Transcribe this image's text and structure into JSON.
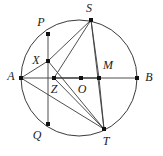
{
  "figure": {
    "background_color": "#ffffff",
    "line_color": "#3b3b3b",
    "highlight_color": "#8c8c8c",
    "dot_color": "#111111",
    "circle": {
      "cx": 79,
      "cy": 78,
      "r": 58
    },
    "points": [
      {
        "id": "P",
        "label": "P",
        "x": 48,
        "y": 34,
        "label_x": 41,
        "label_y": 23
      },
      {
        "id": "S",
        "label": "S",
        "x": 91,
        "y": 20,
        "label_x": 89,
        "label_y": 9
      },
      {
        "id": "X",
        "label": "X",
        "x": 48,
        "y": 61,
        "label_x": 36,
        "label_y": 61
      },
      {
        "id": "A",
        "label": "A",
        "x": 21,
        "y": 78,
        "label_x": 11,
        "label_y": 77
      },
      {
        "id": "Z",
        "label": "Z",
        "x": 54,
        "y": 78,
        "label_x": 54,
        "label_y": 90
      },
      {
        "id": "O",
        "label": "O",
        "x": 81,
        "y": 78,
        "label_x": 82,
        "label_y": 90
      },
      {
        "id": "M",
        "label": "M",
        "x": 99,
        "y": 78,
        "label_x": 108,
        "label_y": 66
      },
      {
        "id": "B",
        "label": "B",
        "x": 137,
        "y": 78,
        "label_x": 149,
        "label_y": 78
      },
      {
        "id": "Q",
        "label": "Q",
        "x": 48,
        "y": 124,
        "label_x": 37,
        "label_y": 136
      },
      {
        "id": "T",
        "label": "T",
        "x": 104,
        "y": 129,
        "label_x": 106,
        "label_y": 142
      }
    ],
    "segments": [
      {
        "name": "segment-P-Q",
        "from": "P",
        "to": "Q",
        "style": "plain"
      },
      {
        "name": "segment-A-B",
        "from": "A",
        "to": "B",
        "style": "plain"
      },
      {
        "name": "segment-S-T",
        "from": "S",
        "to": "T",
        "style": "plain"
      },
      {
        "name": "segment-A-X",
        "from": "A",
        "to": "X",
        "style": "plain"
      },
      {
        "name": "segment-X-S",
        "from": "X",
        "to": "S",
        "style": "plain"
      },
      {
        "name": "segment-X-T",
        "from": "X",
        "to": "T",
        "style": "plain"
      },
      {
        "name": "segment-A-T",
        "from": "A",
        "to": "T",
        "style": "plain"
      },
      {
        "name": "segment-S-Z",
        "from": "S",
        "to": "Z",
        "style": "plain"
      },
      {
        "name": "segment-Z-T",
        "from": "Z",
        "to": "T",
        "style": "plain"
      },
      {
        "name": "segment-S-M",
        "from": "S",
        "to": "M",
        "style": "plain"
      },
      {
        "name": "segment-M-T",
        "from": "M",
        "to": "T",
        "style": "plain"
      },
      {
        "name": "segment-Z-M-highlight",
        "from": "Z",
        "to": "M",
        "style": "highlight"
      }
    ]
  }
}
